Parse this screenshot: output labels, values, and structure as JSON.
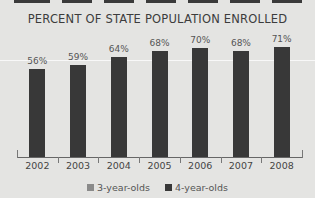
{
  "chart_data": {
    "type": "bar",
    "title": "PERCENT OF STATE POPULATION ENROLLED",
    "categories": [
      "2002",
      "2003",
      "2004",
      "2005",
      "2006",
      "2007",
      "2008"
    ],
    "series": [
      {
        "name": "3-year-olds",
        "color": "#8a8a8a",
        "values": [
          null,
          null,
          null,
          null,
          null,
          null,
          null
        ]
      },
      {
        "name": "4-year-olds",
        "color": "#383838",
        "values": [
          56,
          59,
          64,
          68,
          70,
          68,
          71
        ]
      }
    ],
    "value_labels": [
      "56%",
      "59%",
      "64%",
      "68%",
      "70%",
      "68%",
      "71%"
    ],
    "xlabel": "",
    "ylabel": "",
    "grid": false,
    "legend_position": "bottom"
  },
  "legend": {
    "items": [
      {
        "label": "3-year-olds",
        "color": "#8a8a8a"
      },
      {
        "label": "4-year-olds",
        "color": "#383838"
      }
    ]
  }
}
